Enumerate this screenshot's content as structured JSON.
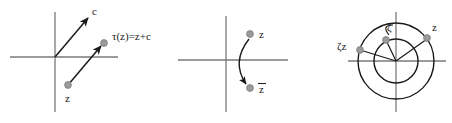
{
  "figure": {
    "type": "math-diagram",
    "background_color": "#ffffff",
    "axis_color": "#7a7a7a",
    "curve_color": "#1a1a1a",
    "point_color": "#9a9a9a",
    "point_stroke": "#7d7d7d",
    "label_color": "#1a1a1a",
    "panels": [
      {
        "name": "translation",
        "origin": {
          "x": 55,
          "y": 57
        },
        "axes": {
          "x_from": 10,
          "x_to": 118,
          "y_from": 12,
          "y_to": 112
        },
        "vectors": [
          {
            "name": "c-vector",
            "from": {
              "x": 55,
              "y": 57
            },
            "to": {
              "x": 90,
              "y": 16
            },
            "label": "c",
            "label_pos": {
              "x": 93,
              "y": 14
            }
          },
          {
            "name": "tau-vector",
            "from": {
              "x": 68,
              "y": 85
            },
            "to": {
              "x": 103,
              "y": 44
            },
            "label": "",
            "label_pos": {
              "x": 0,
              "y": 0
            }
          }
        ],
        "points": [
          {
            "name": "z-point",
            "x": 68,
            "y": 85,
            "label": "z",
            "label_pos": {
              "x": 66,
              "y": 101
            }
          },
          {
            "name": "tau-z-point",
            "x": 104,
            "y": 43,
            "label": "τ(z)=z+c",
            "label_pos": {
              "x": 112,
              "y": 40
            }
          }
        ]
      },
      {
        "name": "conjugation",
        "origin": {
          "x": 226,
          "y": 60
        },
        "axes": {
          "x_from": 178,
          "x_to": 288,
          "y_from": 16,
          "y_to": 112
        },
        "arc": {
          "name": "conjugate-arrow",
          "from": {
            "x": 249,
            "y": 38
          },
          "ctrl": {
            "x": 230,
            "y": 62
          },
          "to": {
            "x": 246,
            "y": 85
          }
        },
        "points": [
          {
            "name": "z-point",
            "x": 250,
            "y": 34,
            "label": "z",
            "label_pos": {
              "x": 259,
              "y": 38
            }
          },
          {
            "name": "z-bar-point",
            "x": 250,
            "y": 88,
            "label": "z",
            "label_pos": {
              "x": 259,
              "y": 92
            },
            "overbar": true
          }
        ]
      },
      {
        "name": "rotation",
        "origin": {
          "x": 396,
          "y": 61
        },
        "axes": {
          "x_from": 348,
          "x_to": 446,
          "y_from": 12,
          "y_to": 112
        },
        "circles": [
          {
            "name": "inner-circle",
            "cx": 396,
            "cy": 61,
            "r": 22
          },
          {
            "name": "outer-circle",
            "cx": 396,
            "cy": 61,
            "r": 38
          }
        ],
        "radii": [
          {
            "name": "radius-to-z",
            "to": {
              "x": 427,
              "y": 39
            }
          },
          {
            "name": "radius-to-zeta",
            "to": {
              "x": 386,
              "y": 40
            }
          },
          {
            "name": "radius-to-zeta-z",
            "to": {
              "x": 360,
              "y": 50
            }
          }
        ],
        "arc": {
          "name": "rotation-arc",
          "from": {
            "x": 388,
            "y": 34
          },
          "ctrl": {
            "x": 383,
            "y": 25
          },
          "to": {
            "x": 393,
            "y": 24
          }
        },
        "points": [
          {
            "name": "z-point",
            "x": 427,
            "y": 38,
            "label": "z",
            "label_pos": {
              "x": 432,
              "y": 30
            }
          },
          {
            "name": "zeta-point",
            "x": 386,
            "y": 40,
            "label": "ζ",
            "label_pos": {
              "x": 388,
              "y": 32
            }
          },
          {
            "name": "zeta-z-point",
            "x": 360,
            "y": 50,
            "label": "ζz",
            "label_pos": {
              "x": 338,
              "y": 48
            }
          }
        ]
      }
    ]
  }
}
